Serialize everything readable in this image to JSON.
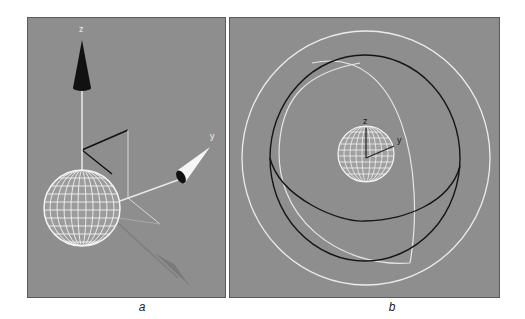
{
  "figure": {
    "panels": [
      {
        "id": "a",
        "caption": "a",
        "axis_labels": {
          "z": "z",
          "y": "y"
        },
        "description": "Wireframe sphere with 3D transform gizmo: black z-axis cone, white y-axis cone, grey shadow cone, L-shaped plane handles"
      },
      {
        "id": "b",
        "caption": "b",
        "axis_labels": {
          "z": "z",
          "y": "y"
        },
        "description": "Wireframe sphere inside rotation gizmo rings: outer white circle, black and white great-circle arcs, local z/y axes"
      }
    ]
  },
  "colors": {
    "background": "#8e8e8e",
    "border": "#5a5a5a",
    "wire_white": "#f4f4f4",
    "axis_black": "#111111",
    "shadow": "#7a7a7a"
  }
}
